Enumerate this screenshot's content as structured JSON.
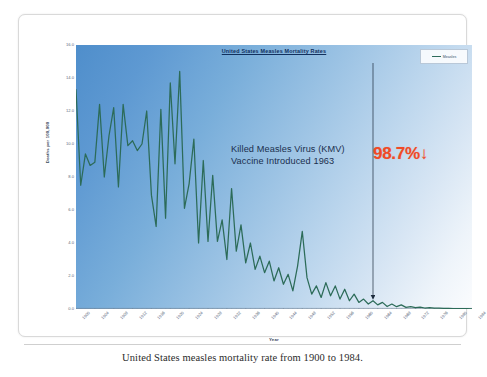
{
  "caption": "United States measles mortality rate from 1900 to 1984.",
  "legend": {
    "label": "Measles"
  },
  "annotation": {
    "text": "Killed Measles Virus (KMV)\nVaccine Introduced 1963",
    "percent": "98.7%",
    "arrow": "↓",
    "percent_color": "#f04a27",
    "marker_year": 1963
  },
  "chart_data": {
    "type": "line",
    "title": "United States Measles Mortality Rates",
    "subtitle": "",
    "xlabel": "Year",
    "ylabel": "Deaths per 100,000",
    "xlim": [
      1900,
      1984
    ],
    "ylim": [
      0.0,
      16.0
    ],
    "grid": false,
    "legend_position": "top-right",
    "series_color": "#2c6b58",
    "background_gradient": [
      "#4f8ecb",
      "#fbfcfe"
    ],
    "ytick_labels": [
      "16.0",
      "14.0",
      "12.0",
      "10.0",
      "8.0",
      "6.0",
      "4.0",
      "2.0",
      "0.0"
    ],
    "ytick_values": [
      16.0,
      14.0,
      12.0,
      10.0,
      8.0,
      6.0,
      4.0,
      2.0,
      0.0
    ],
    "xtick_labels": [
      "1900",
      "1904",
      "1908",
      "1912",
      "1916",
      "1920",
      "1924",
      "1928",
      "1932",
      "1936",
      "1940",
      "1944",
      "1948",
      "1952",
      "1956",
      "1960",
      "1964",
      "1968",
      "1972",
      "1976",
      "1980",
      "1984"
    ],
    "xtick_values": [
      1900,
      1904,
      1908,
      1912,
      1916,
      1920,
      1924,
      1928,
      1932,
      1936,
      1940,
      1944,
      1948,
      1952,
      1956,
      1960,
      1964,
      1968,
      1972,
      1976,
      1980,
      1984
    ],
    "series": [
      {
        "name": "Measles",
        "x": [
          1900,
          1901,
          1902,
          1903,
          1904,
          1905,
          1906,
          1907,
          1908,
          1909,
          1910,
          1911,
          1912,
          1913,
          1914,
          1915,
          1916,
          1917,
          1918,
          1919,
          1920,
          1921,
          1922,
          1923,
          1924,
          1925,
          1926,
          1927,
          1928,
          1929,
          1930,
          1931,
          1932,
          1933,
          1934,
          1935,
          1936,
          1937,
          1938,
          1939,
          1940,
          1941,
          1942,
          1943,
          1944,
          1945,
          1946,
          1947,
          1948,
          1949,
          1950,
          1951,
          1952,
          1953,
          1954,
          1955,
          1956,
          1957,
          1958,
          1959,
          1960,
          1961,
          1962,
          1963,
          1964,
          1965,
          1966,
          1967,
          1968,
          1969,
          1970,
          1971,
          1972,
          1973,
          1974,
          1975,
          1976,
          1977,
          1978,
          1979,
          1980,
          1981,
          1982,
          1983,
          1984
        ],
        "values": [
          13.3,
          7.5,
          9.4,
          8.7,
          8.9,
          12.4,
          8.0,
          10.5,
          12.2,
          7.4,
          12.4,
          9.9,
          10.2,
          9.6,
          10.0,
          12.0,
          6.9,
          5.0,
          12.1,
          5.5,
          13.7,
          8.8,
          14.4,
          6.1,
          7.6,
          10.3,
          4.0,
          9.0,
          4.1,
          8.1,
          4.1,
          5.4,
          3.0,
          7.3,
          3.5,
          5.1,
          2.8,
          4.0,
          2.4,
          3.2,
          2.2,
          2.9,
          1.7,
          2.5,
          1.5,
          2.1,
          1.1,
          2.6,
          4.7,
          1.9,
          0.9,
          1.4,
          0.7,
          1.6,
          0.8,
          1.4,
          0.6,
          1.2,
          0.5,
          0.9,
          0.4,
          0.6,
          0.3,
          0.5,
          0.25,
          0.4,
          0.15,
          0.3,
          0.14,
          0.25,
          0.1,
          0.15,
          0.08,
          0.12,
          0.06,
          0.08,
          0.05,
          0.06,
          0.04,
          0.04,
          0.03,
          0.02,
          0.02,
          0.02,
          0.01
        ]
      }
    ]
  }
}
